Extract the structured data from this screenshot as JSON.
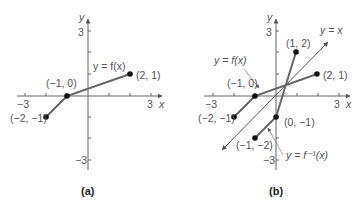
{
  "panels": [
    {
      "caption": "(a)",
      "axis": {
        "x_label": "x",
        "y_label": "y",
        "x_min_tick": "−3",
        "x_max_tick": "3",
        "y_max_tick": "3",
        "y_min_tick": "−3"
      },
      "curve_label": "y = f(x)",
      "points": [
        {
          "label": "(−2, −1)",
          "x": -2,
          "y": -1
        },
        {
          "label": "(−1, 0)",
          "x": -1,
          "y": 0
        },
        {
          "label": "(2, 1)",
          "x": 2,
          "y": 1
        }
      ]
    },
    {
      "caption": "(b)",
      "axis": {
        "x_label": "x",
        "y_label": "y",
        "x_min_tick": "−3",
        "x_max_tick": "3",
        "y_max_tick": "3",
        "y_min_tick": "−3"
      },
      "curve_label": "y = f(x)",
      "inverse_label": "y = f⁻¹(x)",
      "identity_label": "y = x",
      "points_f": [
        {
          "label": "(−2, −1)",
          "x": -2,
          "y": -1
        },
        {
          "label": "(−1, 0)",
          "x": -1,
          "y": 0
        },
        {
          "label": "(2, 1)",
          "x": 2,
          "y": 1
        }
      ],
      "points_inverse": [
        {
          "label": "(−1, −2)",
          "x": -1,
          "y": -2
        },
        {
          "label": "(0, −1)",
          "x": 0,
          "y": -1
        },
        {
          "label": "(1, 2)",
          "x": 1,
          "y": 2
        }
      ]
    }
  ],
  "colors": {
    "axis": "#555555",
    "curve": "#666666",
    "point": "#111111",
    "text": "#555555"
  }
}
